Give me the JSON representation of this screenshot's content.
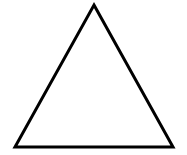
{
  "image": {
    "kind": "line-drawing",
    "width": 187,
    "height": 155,
    "background_color": "#FFFFFF",
    "description": "Black outline of an upright isosceles triangle on a plain white background"
  },
  "figure": {
    "name": "triangle",
    "shape_type": "triangle",
    "filled": false,
    "fill_color": "none",
    "stroke_color": "#000000",
    "stroke_width": 3,
    "orientation": "apex-up",
    "vertices": [
      {
        "label": "apex",
        "x": 94,
        "y": 5
      },
      {
        "label": "bottom-right",
        "x": 173,
        "y": 147
      },
      {
        "label": "bottom-left",
        "x": 15,
        "y": 147
      }
    ],
    "points_attr": "94,5 173,147 15,147",
    "base_width": 158,
    "height_px": 142,
    "edges": [
      {
        "label": "left-edge",
        "from": "apex",
        "to": "bottom-left"
      },
      {
        "label": "right-edge",
        "from": "apex",
        "to": "bottom-right"
      },
      {
        "label": "base-edge",
        "from": "bottom-left",
        "to": "bottom-right"
      }
    ]
  },
  "labels": {
    "text_present": false,
    "items": []
  }
}
